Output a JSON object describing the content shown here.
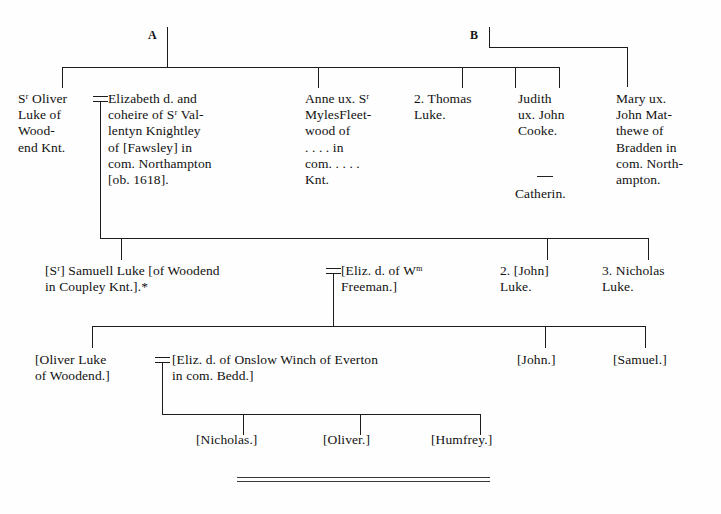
{
  "document": {
    "type": "genealogical-pedigree-chart",
    "title": "Luke of Woodend pedigree"
  },
  "branch_tags": [
    {
      "label": "A",
      "x": 148,
      "y": 28
    },
    {
      "label": "B",
      "x": 470,
      "y": 28
    }
  ],
  "generation1": {
    "nodes": [
      {
        "name": "sr-oliver-luke",
        "lines": "Sʳ Oliver\nLuke of\nWood-\nend Knt.",
        "x": 18,
        "y": 91,
        "width": 80
      },
      {
        "name": "elizabeth-knightley",
        "lines": "Elizabeth d. and\ncoheire of Sʳ Val-\nlentyn Knightley\nof [Fawsley] in\ncom. Northampton\n[ob. 1618].",
        "x": 107,
        "y": 91,
        "width": 175
      },
      {
        "name": "anne-fleetwood",
        "lines": "Anne ux. Sʳ\nMylesFleet-\nwood of\n. . . . in\ncom. . . . .\nKnt.",
        "x": 305,
        "y": 91,
        "width": 100
      },
      {
        "name": "thomas-luke",
        "lines": "2. Thomas\nLuke.",
        "x": 414,
        "y": 91,
        "width": 90
      },
      {
        "name": "judith-cooke",
        "lines": "Judith\nux. John\nCooke.",
        "x": 518,
        "y": 91,
        "width": 80
      },
      {
        "name": "catherin",
        "lines": "Catherin.",
        "x": 518,
        "y": 186,
        "width": 80
      },
      {
        "name": "mary-matthewe",
        "lines": "Mary ux.\nJohn Mat-\nthewe of\nBradden in\ncom. North-\nampton.",
        "x": 616,
        "y": 91,
        "width": 100
      }
    ]
  },
  "generation2": {
    "nodes": [
      {
        "name": "sr-samuell-luke",
        "lines": "[Sʳ] Samuell Luke [of Woodend\nin Coupley Knt.].*",
        "x": 45,
        "y": 263,
        "width": 290
      },
      {
        "name": "eliz-freeman",
        "lines": "[Eliz. d. of Wᵐ\nFreeman.]",
        "x": 340,
        "y": 263,
        "width": 140
      },
      {
        "name": "john-luke-2",
        "lines": "2. [John]\nLuke.",
        "x": 500,
        "y": 263,
        "width": 90
      },
      {
        "name": "nicholas-luke-3",
        "lines": "3. Nicholas\nLuke.",
        "x": 602,
        "y": 263,
        "width": 100
      }
    ]
  },
  "generation3": {
    "nodes": [
      {
        "name": "oliver-luke",
        "lines": "[Oliver Luke\nof Woodend.]",
        "x": 35,
        "y": 352,
        "width": 125
      },
      {
        "name": "eliz-winch",
        "lines": "[Eliz. d. of Onslow Winch of Everton\nin com. Bedd.]",
        "x": 172,
        "y": 352,
        "width": 330
      },
      {
        "name": "john-3",
        "lines": "[John.]",
        "x": 517,
        "y": 352,
        "width": 70
      },
      {
        "name": "samuel-3",
        "lines": "[Samuel.]",
        "x": 613,
        "y": 352,
        "width": 90
      }
    ]
  },
  "generation4": {
    "nodes": [
      {
        "name": "nicholas-4",
        "lines": "[Nicholas.]",
        "x": 196,
        "y": 432,
        "width": 100
      },
      {
        "name": "oliver-4",
        "lines": "[Oliver.]",
        "x": 323,
        "y": 432,
        "width": 80
      },
      {
        "name": "humfrey-4",
        "lines": "[Humfrey.]",
        "x": 431,
        "y": 432,
        "width": 100
      }
    ]
  },
  "footer": {
    "caption": ""
  },
  "colors": {
    "ink": "#1c1c1c",
    "paper": "#fefefe"
  }
}
